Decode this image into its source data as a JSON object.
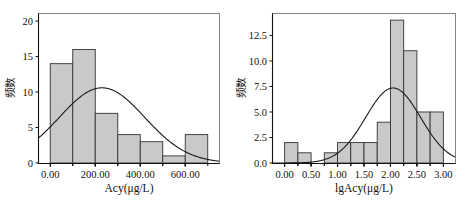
{
  "figure": {
    "panels": [
      {
        "id": "panel-acy",
        "chart_data": {
          "type": "bar",
          "title": "",
          "subtitle": "",
          "xlabel": "Acy(μg/L)",
          "ylabel": "频数",
          "xlim": [
            -50,
            750
          ],
          "ylim": [
            0,
            21
          ],
          "grid": false,
          "legend": "none",
          "xticks": [
            0,
            200,
            400,
            600
          ],
          "xtick_labels": [
            "0.00",
            "200.00",
            "400.00",
            "600.00"
          ],
          "yticks": [
            0,
            5,
            10,
            15,
            20
          ],
          "ytick_labels": [
            "0",
            "5",
            "10",
            "15",
            "20"
          ],
          "bin_width": 100,
          "bins": [
            {
              "start": 0,
              "end": 100,
              "value": 14
            },
            {
              "start": 100,
              "end": 200,
              "value": 16
            },
            {
              "start": 200,
              "end": 300,
              "value": 7
            },
            {
              "start": 300,
              "end": 400,
              "value": 4
            },
            {
              "start": 400,
              "end": 500,
              "value": 3
            },
            {
              "start": 500,
              "end": 600,
              "value": 1
            },
            {
              "start": 600,
              "end": 700,
              "value": 4
            }
          ],
          "categories": [
            "0-100",
            "100-200",
            "200-300",
            "300-400",
            "400-500",
            "500-600",
            "600-700"
          ],
          "values": [
            14,
            16,
            7,
            4,
            3,
            1,
            4
          ],
          "overlay": {
            "type": "line",
            "name": "normal-curve",
            "mean": 230,
            "sigma": 190,
            "peak": 10.6
          }
        }
      },
      {
        "id": "panel-lgacy",
        "chart_data": {
          "type": "bar",
          "title": "",
          "subtitle": "",
          "xlabel": "lgAcy(μg/L)",
          "ylabel": "频数",
          "xlim": [
            -0.22,
            3.22
          ],
          "ylim": [
            0,
            14.6
          ],
          "grid": false,
          "legend": "none",
          "xticks": [
            0.0,
            0.5,
            1.0,
            1.5,
            2.0,
            2.5,
            3.0
          ],
          "xtick_labels": [
            "0.00",
            "0.50",
            "1.00",
            "1.50",
            "2.00",
            "2.50",
            "3.00"
          ],
          "yticks": [
            0.0,
            2.5,
            5.0,
            7.5,
            10.0,
            12.5
          ],
          "ytick_labels": [
            "0.0",
            "2.5",
            "5.0",
            "7.5",
            "10.0",
            "12.5"
          ],
          "bin_width": 0.25,
          "bins": [
            {
              "start": 0.0,
              "end": 0.25,
              "value": 2
            },
            {
              "start": 0.25,
              "end": 0.5,
              "value": 1
            },
            {
              "start": 0.5,
              "end": 0.75,
              "value": 0
            },
            {
              "start": 0.75,
              "end": 1.0,
              "value": 1
            },
            {
              "start": 1.0,
              "end": 1.25,
              "value": 2
            },
            {
              "start": 1.25,
              "end": 1.5,
              "value": 2
            },
            {
              "start": 1.5,
              "end": 1.75,
              "value": 2
            },
            {
              "start": 1.75,
              "end": 2.0,
              "value": 4
            },
            {
              "start": 2.0,
              "end": 2.25,
              "value": 14
            },
            {
              "start": 2.25,
              "end": 2.5,
              "value": 11
            },
            {
              "start": 2.5,
              "end": 2.75,
              "value": 5
            },
            {
              "start": 2.75,
              "end": 3.0,
              "value": 5
            }
          ],
          "categories": [
            "0.00-0.25",
            "0.25-0.50",
            "0.50-0.75",
            "0.75-1.00",
            "1.00-1.25",
            "1.25-1.50",
            "1.50-1.75",
            "1.75-2.00",
            "2.00-2.25",
            "2.25-2.50",
            "2.50-2.75",
            "2.75-3.00"
          ],
          "values": [
            2,
            1,
            0,
            1,
            2,
            2,
            2,
            4,
            14,
            11,
            5,
            5
          ],
          "overlay": {
            "type": "line",
            "name": "normal-curve",
            "mean": 2.05,
            "sigma": 0.52,
            "peak": 7.35
          }
        }
      }
    ],
    "colors": {
      "bar_fill": "#c9c9c9",
      "bar_stroke": "#333333",
      "curve": "#1a1a1a",
      "frame": "#777777",
      "axis": "#111111",
      "background": "#ffffff"
    }
  }
}
